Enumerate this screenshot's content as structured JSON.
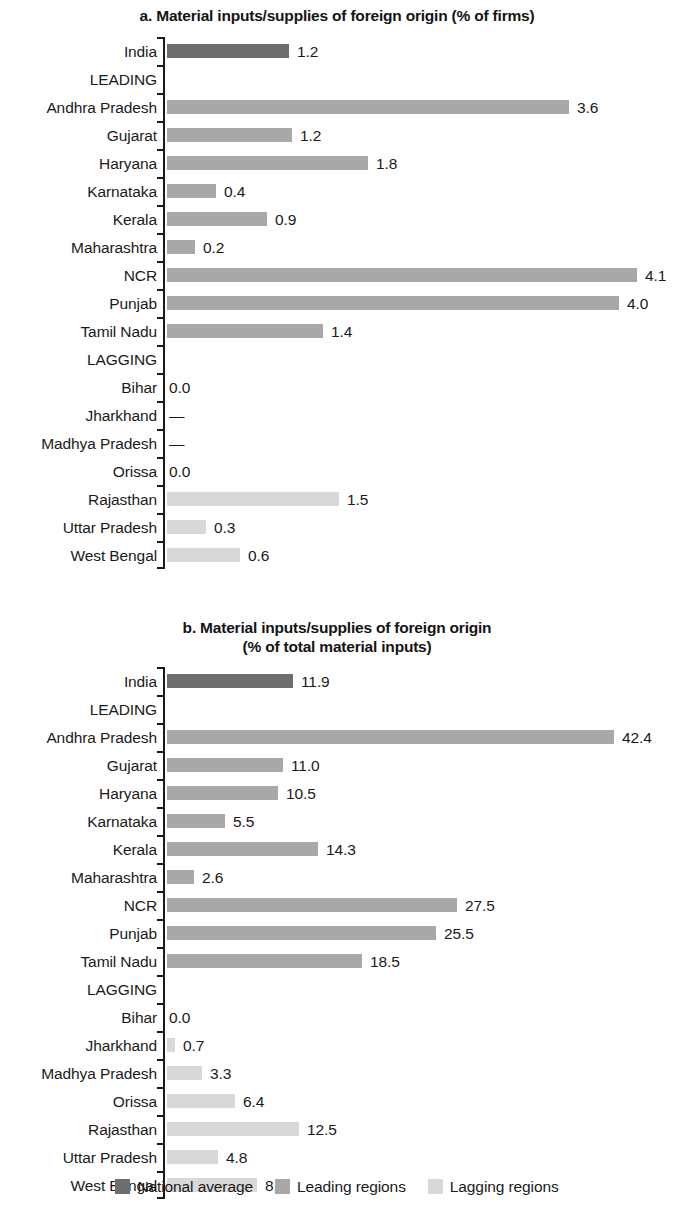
{
  "figure": {
    "legend": [
      {
        "label": "National average",
        "series": "national",
        "color": "#6e6e6e"
      },
      {
        "label": "Leading regions",
        "series": "leading",
        "color": "#a8a8a8"
      },
      {
        "label": "Lagging regions",
        "series": "lagging",
        "color": "#d8d8d8"
      }
    ]
  },
  "panel_a": {
    "title": "a. Material inputs/supplies of foreign origin (% of firms)"
  },
  "panel_b": {
    "title_line1": "b. Material inputs/supplies of foreign origin",
    "title_line2": "(% of total material inputs)"
  },
  "chart_data": [
    {
      "type": "bar",
      "orientation": "horizontal",
      "panel": "a",
      "title": "a. Material inputs/supplies of foreign origin (% of firms)",
      "xlabel": "",
      "ylabel": "",
      "unit": "% of firms",
      "grid": false,
      "legend_position": "bottom",
      "xlim": [
        0,
        4.1
      ],
      "categories": [
        "India",
        "LEADING",
        "Andhra Pradesh",
        "Gujarat",
        "Haryana",
        "Karnataka",
        "Kerala",
        "Maharashtra",
        "NCR",
        "Punjab",
        "Tamil Nadu",
        "LAGGING",
        "Bihar",
        "Jharkhand",
        "Madhya Pradesh",
        "Orissa",
        "Rajasthan",
        "Uttar Pradesh",
        "West Bengal"
      ],
      "points": [
        {
          "category": "India",
          "value": 1.2,
          "label": "1.2",
          "series": "national",
          "bar_px": 122,
          "group_header": false
        },
        {
          "category": "LEADING",
          "value": null,
          "label": "",
          "series": "header",
          "bar_px": 0,
          "group_header": true
        },
        {
          "category": "Andhra Pradesh",
          "value": 3.6,
          "label": "3.6",
          "series": "leading",
          "bar_px": 402,
          "group_header": false
        },
        {
          "category": "Gujarat",
          "value": 1.2,
          "label": "1.2",
          "series": "leading",
          "bar_px": 125,
          "group_header": false
        },
        {
          "category": "Haryana",
          "value": 1.8,
          "label": "1.8",
          "series": "leading",
          "bar_px": 201,
          "group_header": false
        },
        {
          "category": "Karnataka",
          "value": 0.4,
          "label": "0.4",
          "series": "leading",
          "bar_px": 49,
          "group_header": false
        },
        {
          "category": "Kerala",
          "value": 0.9,
          "label": "0.9",
          "series": "leading",
          "bar_px": 100,
          "group_header": false
        },
        {
          "category": "Maharashtra",
          "value": 0.2,
          "label": "0.2",
          "series": "leading",
          "bar_px": 28,
          "group_header": false
        },
        {
          "category": "NCR",
          "value": 4.1,
          "label": "4.1",
          "series": "leading",
          "bar_px": 470,
          "group_header": false
        },
        {
          "category": "Punjab",
          "value": 4.0,
          "label": "4.0",
          "series": "leading",
          "bar_px": 452,
          "group_header": false
        },
        {
          "category": "Tamil Nadu",
          "value": 1.4,
          "label": "1.4",
          "series": "leading",
          "bar_px": 156,
          "group_header": false
        },
        {
          "category": "LAGGING",
          "value": null,
          "label": "",
          "series": "header",
          "bar_px": 0,
          "group_header": true
        },
        {
          "category": "Bihar",
          "value": 0.0,
          "label": "0.0",
          "series": "lagging",
          "bar_px": 0,
          "group_header": false
        },
        {
          "category": "Jharkhand",
          "value": null,
          "label": "—",
          "series": "lagging",
          "bar_px": 0,
          "group_header": false
        },
        {
          "category": "Madhya Pradesh",
          "value": null,
          "label": "—",
          "series": "lagging",
          "bar_px": 0,
          "group_header": false
        },
        {
          "category": "Orissa",
          "value": 0.0,
          "label": "0.0",
          "series": "lagging",
          "bar_px": 0,
          "group_header": false
        },
        {
          "category": "Rajasthan",
          "value": 1.5,
          "label": "1.5",
          "series": "lagging",
          "bar_px": 172,
          "group_header": false
        },
        {
          "category": "Uttar Pradesh",
          "value": 0.3,
          "label": "0.3",
          "series": "lagging",
          "bar_px": 39,
          "group_header": false
        },
        {
          "category": "West Bengal",
          "value": 0.6,
          "label": "0.6",
          "series": "lagging",
          "bar_px": 73,
          "group_header": false
        }
      ]
    },
    {
      "type": "bar",
      "orientation": "horizontal",
      "panel": "b",
      "title": "b. Material inputs/supplies of foreign origin (% of total material inputs)",
      "xlabel": "",
      "ylabel": "",
      "unit": "% of total material inputs",
      "grid": false,
      "legend_position": "bottom",
      "xlim": [
        0,
        42.4
      ],
      "categories": [
        "India",
        "LEADING",
        "Andhra Pradesh",
        "Gujarat",
        "Haryana",
        "Karnataka",
        "Kerala",
        "Maharashtra",
        "NCR",
        "Punjab",
        "Tamil Nadu",
        "LAGGING",
        "Bihar",
        "Jharkhand",
        "Madhya Pradesh",
        "Orissa",
        "Rajasthan",
        "Uttar Pradesh",
        "West Bengal"
      ],
      "points": [
        {
          "category": "India",
          "value": 11.9,
          "label": "11.9",
          "series": "national",
          "bar_px": 126,
          "group_header": false
        },
        {
          "category": "LEADING",
          "value": null,
          "label": "",
          "series": "header",
          "bar_px": 0,
          "group_header": true
        },
        {
          "category": "Andhra Pradesh",
          "value": 42.4,
          "label": "42.4",
          "series": "leading",
          "bar_px": 447,
          "group_header": false
        },
        {
          "category": "Gujarat",
          "value": 11.0,
          "label": "11.0",
          "series": "leading",
          "bar_px": 116,
          "group_header": false
        },
        {
          "category": "Haryana",
          "value": 10.5,
          "label": "10.5",
          "series": "leading",
          "bar_px": 111,
          "group_header": false
        },
        {
          "category": "Karnataka",
          "value": 5.5,
          "label": "5.5",
          "series": "leading",
          "bar_px": 58,
          "group_header": false
        },
        {
          "category": "Kerala",
          "value": 14.3,
          "label": "14.3",
          "series": "leading",
          "bar_px": 151,
          "group_header": false
        },
        {
          "category": "Maharashtra",
          "value": 2.6,
          "label": "2.6",
          "series": "leading",
          "bar_px": 27,
          "group_header": false
        },
        {
          "category": "NCR",
          "value": 27.5,
          "label": "27.5",
          "series": "leading",
          "bar_px": 290,
          "group_header": false
        },
        {
          "category": "Punjab",
          "value": 25.5,
          "label": "25.5",
          "series": "leading",
          "bar_px": 269,
          "group_header": false
        },
        {
          "category": "Tamil Nadu",
          "value": 18.5,
          "label": "18.5",
          "series": "leading",
          "bar_px": 195,
          "group_header": false
        },
        {
          "category": "LAGGING",
          "value": null,
          "label": "",
          "series": "header",
          "bar_px": 0,
          "group_header": true
        },
        {
          "category": "Bihar",
          "value": 0.0,
          "label": "0.0",
          "series": "lagging",
          "bar_px": 0,
          "group_header": false
        },
        {
          "category": "Jharkhand",
          "value": 0.7,
          "label": "0.7",
          "series": "lagging",
          "bar_px": 8,
          "group_header": false
        },
        {
          "category": "Madhya Pradesh",
          "value": 3.3,
          "label": "3.3",
          "series": "lagging",
          "bar_px": 35,
          "group_header": false
        },
        {
          "category": "Orissa",
          "value": 6.4,
          "label": "6.4",
          "series": "lagging",
          "bar_px": 68,
          "group_header": false
        },
        {
          "category": "Rajasthan",
          "value": 12.5,
          "label": "12.5",
          "series": "lagging",
          "bar_px": 132,
          "group_header": false
        },
        {
          "category": "Uttar Pradesh",
          "value": 4.8,
          "label": "4.8",
          "series": "lagging",
          "bar_px": 51,
          "group_header": false
        },
        {
          "category": "West Bengal",
          "value": 8.5,
          "label": "8.5",
          "series": "lagging",
          "bar_px": 90,
          "group_header": false
        }
      ]
    }
  ]
}
